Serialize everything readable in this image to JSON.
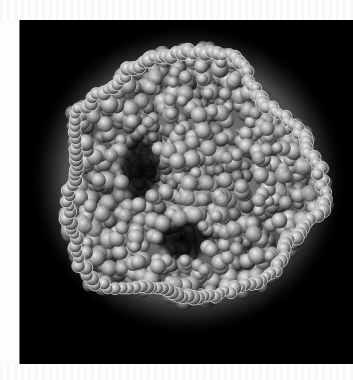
{
  "image": {
    "description": "Grayscale scanning electron micrograph of a rounded cluster of small spherical particles on a black background",
    "colors": {
      "page_background": "#ffffff",
      "panel_background": "#000000",
      "halo": "#cfcfcf",
      "particle_light": "#e6e6e6",
      "particle_mid": "#8a8a8a",
      "particle_dark": "#2a2a2a"
    },
    "cluster": {
      "center_x": 168,
      "center_y": 160,
      "radius_x": 130,
      "radius_y": 128
    },
    "cavities": [
      {
        "cx": 120,
        "cy": 150,
        "rx": 22,
        "ry": 38
      },
      {
        "cx": 165,
        "cy": 220,
        "rx": 30,
        "ry": 22
      }
    ]
  }
}
